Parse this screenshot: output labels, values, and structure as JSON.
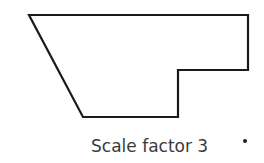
{
  "diagram": {
    "type": "polygon",
    "stroke_color": "#1a1a1a",
    "fill_color": "#ffffff",
    "points": "29,15 248,15 248,70 178,70 178,117 83,117",
    "caption": "Scale factor 3",
    "marker": "dot"
  }
}
